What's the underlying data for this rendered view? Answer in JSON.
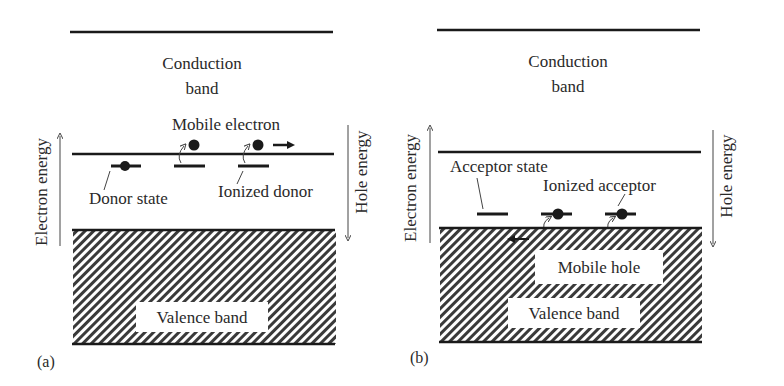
{
  "panel_a": {
    "label": "(a)",
    "conduction_band": {
      "line1": "Conduction",
      "line2": "band"
    },
    "valence_band": "Valence band",
    "mobile_electron": "Mobile electron",
    "donor_state": "Donor state",
    "ionized_donor": "Ionized donor",
    "left_axis": "Electron energy",
    "right_axis": "Hole energy"
  },
  "panel_b": {
    "label": "(b)",
    "conduction_band": {
      "line1": "Conduction",
      "line2": "band"
    },
    "valence_band": "Valence band",
    "mobile_hole": "Mobile hole",
    "acceptor_state": "Acceptor state",
    "ionized_acceptor": "Ionized acceptor",
    "left_axis": "Electron energy",
    "right_axis": "Hole energy"
  },
  "colors": {
    "line": "#1a1a1a",
    "hatch": "#3a3a3a",
    "text": "#2a2a2a",
    "background": "#ffffff"
  }
}
